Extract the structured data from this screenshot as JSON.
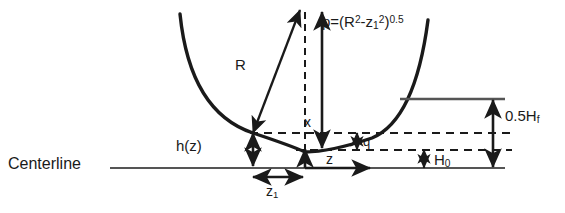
{
  "diagram": {
    "background_color": "#ffffff",
    "stroke_color": "#1a1a1a",
    "labels": {
      "centerline": "Centerline",
      "radius": "R",
      "depth_function": "h(z)",
      "x_coordinate": "x",
      "z_coordinate": "z",
      "z1_coordinate": "z",
      "z1_subscript": "1",
      "q_gap": "q",
      "H0_base": "H",
      "H0_subscript": "0",
      "Hf_height": "0.5H",
      "Hf_subscript": "f"
    },
    "formula": {
      "lhs": "p=(R",
      "sup1": "2",
      "mid": "-z",
      "sub1": "1",
      "sup2": "2",
      "rhs": ")",
      "exponent": "0.5",
      "full_text": "p=(R2-z12)0.5"
    }
  },
  "geometry": {
    "arc": {
      "type": "circular-arc-opening-up",
      "left_end": [
        180,
        14
      ],
      "bottom": [
        305,
        152
      ],
      "right_end": [
        428,
        20
      ]
    },
    "centerline_y": 168,
    "centerline_x_range": [
      110,
      505
    ],
    "dashed_line_upper_y": 134,
    "dashed_line_lower_y": 150,
    "free_surface_line_y": 99,
    "free_surface_x_range": [
      400,
      505
    ],
    "apex_point": [
      305,
      152
    ],
    "contact_point": [
      253,
      133
    ],
    "arrow_tip_top": [
      305,
      12
    ],
    "measure_Hf_x": 493,
    "measure_z1_y": 177
  }
}
